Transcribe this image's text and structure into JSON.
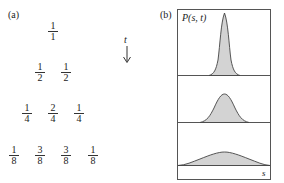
{
  "panel_a": {
    "label": "(a)",
    "time_label": "t",
    "rows": [
      [
        {
          "num": "1",
          "den": "1"
        }
      ],
      [
        {
          "num": "1",
          "den": "2"
        },
        {
          "num": "1",
          "den": "2"
        }
      ],
      [
        {
          "num": "1",
          "den": "4"
        },
        {
          "num": "2",
          "den": "4"
        },
        {
          "num": "1",
          "den": "4"
        }
      ],
      [
        {
          "num": "1",
          "den": "8"
        },
        {
          "num": "3",
          "den": "8"
        },
        {
          "num": "3",
          "den": "8"
        },
        {
          "num": "1",
          "den": "8"
        }
      ]
    ]
  },
  "panel_b": {
    "label": "(b)",
    "title": "P(s, t)",
    "x_axis_label": "s",
    "fill_color": "#d3d3d3",
    "stroke_color": "#444444",
    "curves": [
      {
        "name": "early",
        "shape": "narrow-peak"
      },
      {
        "name": "middle",
        "shape": "medium-peak"
      },
      {
        "name": "late",
        "shape": "broad-peak"
      }
    ]
  }
}
